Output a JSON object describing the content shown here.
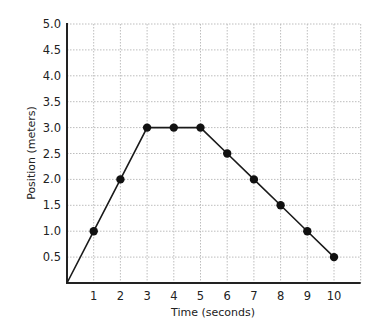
{
  "chart_data": {
    "type": "line",
    "title": "",
    "xlabel": "Time (seconds)",
    "ylabel": "Position (meters)",
    "x": [
      0,
      1,
      2,
      3,
      4,
      5,
      6,
      7,
      8,
      9,
      10
    ],
    "series": [
      {
        "name": "Position",
        "values": [
          0,
          1.0,
          2.0,
          3.0,
          3.0,
          3.0,
          2.5,
          2.0,
          1.5,
          1.0,
          0.5
        ],
        "markers": [
          false,
          true,
          true,
          true,
          true,
          true,
          true,
          true,
          true,
          true,
          true
        ]
      }
    ],
    "xticks": [
      "1",
      "2",
      "3",
      "4",
      "5",
      "6",
      "7",
      "8",
      "9",
      "10"
    ],
    "yticks": [
      "0.5",
      "1.0",
      "1.5",
      "2.0",
      "2.5",
      "3.0",
      "3.5",
      "4.0",
      "4.5",
      "5.0"
    ],
    "xlim": [
      0,
      11
    ],
    "ylim": [
      0,
      5.0
    ],
    "grid": true,
    "legend": null
  }
}
